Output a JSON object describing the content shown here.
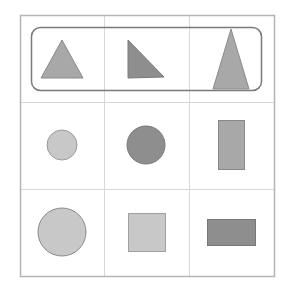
{
  "grid": {
    "rows": 3,
    "cols": 3,
    "border_color": "#b4b4b4",
    "line_color": "#d8d8d8",
    "highlight_row": 1,
    "highlight_stroke": "#7a7a7a"
  },
  "colors": {
    "light": "#c8c8c8",
    "medium": "#a8a8a8",
    "dark": "#8e8e8e",
    "stroke": "#8a8a8a"
  },
  "cells": [
    {
      "row": 1,
      "col": 1,
      "shape": "triangle",
      "variant": "isosceles",
      "fill": "medium"
    },
    {
      "row": 1,
      "col": 2,
      "shape": "triangle",
      "variant": "right",
      "fill": "dark"
    },
    {
      "row": 1,
      "col": 3,
      "shape": "triangle",
      "variant": "tall",
      "fill": "medium"
    },
    {
      "row": 2,
      "col": 1,
      "shape": "circle",
      "size": "small",
      "fill": "light"
    },
    {
      "row": 2,
      "col": 2,
      "shape": "circle",
      "size": "medium",
      "fill": "dark"
    },
    {
      "row": 2,
      "col": 3,
      "shape": "rectangle",
      "orientation": "vertical",
      "fill": "medium"
    },
    {
      "row": 3,
      "col": 1,
      "shape": "circle",
      "size": "large",
      "fill": "light"
    },
    {
      "row": 3,
      "col": 2,
      "shape": "square",
      "fill": "light"
    },
    {
      "row": 3,
      "col": 3,
      "shape": "rectangle",
      "orientation": "horizontal",
      "fill": "dark"
    }
  ]
}
